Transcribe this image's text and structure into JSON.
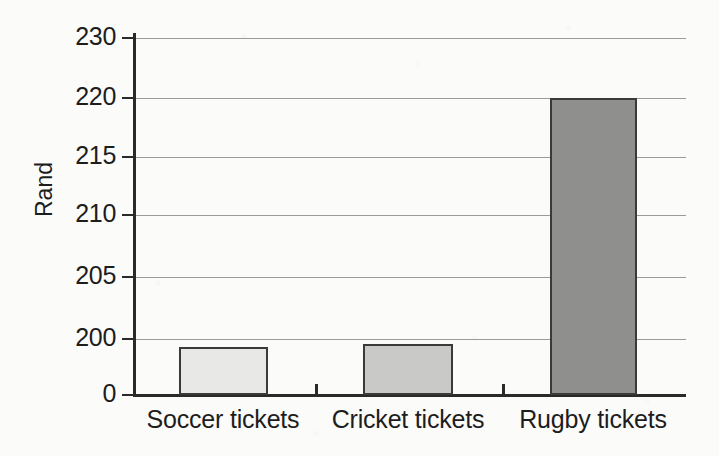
{
  "chart_data": {
    "type": "bar",
    "title": "",
    "xlabel": "",
    "ylabel": "Rand",
    "categories": [
      "Soccer tickets",
      "Cricket tickets",
      "Rugby tickets"
    ],
    "values": [
      199.3,
      199.6,
      220
    ],
    "series": [
      {
        "name": "Ticket price",
        "values": [
          199.3,
          199.6,
          220
        ]
      }
    ],
    "bar_colors": [
      "#e8e8e6",
      "#c9c9c7",
      "#8f8f8d"
    ],
    "bar_edge_color": "#3a3a3a",
    "grid": true,
    "grid_axis": "y",
    "legend": "none",
    "y_axis_note": "broken / non-linear scale: 0 then 200,205,210,215,220,230",
    "ylim": [
      0,
      230
    ],
    "y_ticks": [
      {
        "label": "230",
        "value": 230
      },
      {
        "label": "220",
        "value": 220
      },
      {
        "label": "215",
        "value": 215
      },
      {
        "label": "210",
        "value": 210
      },
      {
        "label": "205",
        "value": 205
      },
      {
        "label": "200",
        "value": 200
      },
      {
        "label": "0",
        "value": 0
      }
    ]
  },
  "layout": {
    "y_tick_pixels": [
      38,
      98,
      157,
      215,
      277,
      339,
      395
    ],
    "bars_px": [
      {
        "left": 179,
        "width": 89,
        "top": 347
      },
      {
        "left": 363,
        "width": 90,
        "top": 344
      },
      {
        "left": 550,
        "width": 87,
        "top": 98
      }
    ],
    "x_tick_pixels": [
      315,
      502
    ],
    "x_label_centers": [
      223,
      408,
      593
    ]
  },
  "colors": {
    "background": "#fbfbf9",
    "axis": "#2a2a2a",
    "grid": "#9a9a9a",
    "text": "#1d1d1d"
  }
}
